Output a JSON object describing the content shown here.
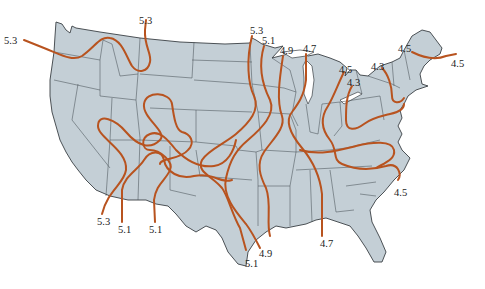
{
  "map": {
    "subject": "Contiguous United States contour map",
    "colors": {
      "land": "#c4cfd6",
      "borders": "#3a3f44",
      "contour": "#b8531f",
      "background": "#ffffff"
    }
  },
  "contour_labels": [
    {
      "id": "nw-53",
      "value": "5.3",
      "x": 4,
      "y": 36
    },
    {
      "id": "mt-53",
      "value": "5.3",
      "x": 139,
      "y": 16
    },
    {
      "id": "mn-53",
      "value": "5.3",
      "x": 250,
      "y": 26
    },
    {
      "id": "mn-51",
      "value": "5.1",
      "x": 262,
      "y": 36
    },
    {
      "id": "wi-49",
      "value": "4.9",
      "x": 280,
      "y": 46
    },
    {
      "id": "mi-47",
      "value": "4.7",
      "x": 303,
      "y": 44
    },
    {
      "id": "mi-45",
      "value": "4.5",
      "x": 339,
      "y": 65
    },
    {
      "id": "mi-43",
      "value": "4.3",
      "x": 347,
      "y": 78
    },
    {
      "id": "ny-43",
      "value": "4.3",
      "x": 371,
      "y": 62
    },
    {
      "id": "ne-45a",
      "value": "4.5",
      "x": 398,
      "y": 44
    },
    {
      "id": "ne-45b",
      "value": "4.5",
      "x": 451,
      "y": 59
    },
    {
      "id": "sw-53",
      "value": "5.3",
      "x": 97,
      "y": 217
    },
    {
      "id": "sw-51a",
      "value": "5.1",
      "x": 118,
      "y": 225
    },
    {
      "id": "sw-51b",
      "value": "5.1",
      "x": 149,
      "y": 225
    },
    {
      "id": "tx-51",
      "value": "5.1",
      "x": 245,
      "y": 259
    },
    {
      "id": "tx-49",
      "value": "4.9",
      "x": 259,
      "y": 249
    },
    {
      "id": "gulf-47",
      "value": "4.7",
      "x": 320,
      "y": 239
    },
    {
      "id": "nc-45",
      "value": "4.5",
      "x": 394,
      "y": 188
    }
  ]
}
